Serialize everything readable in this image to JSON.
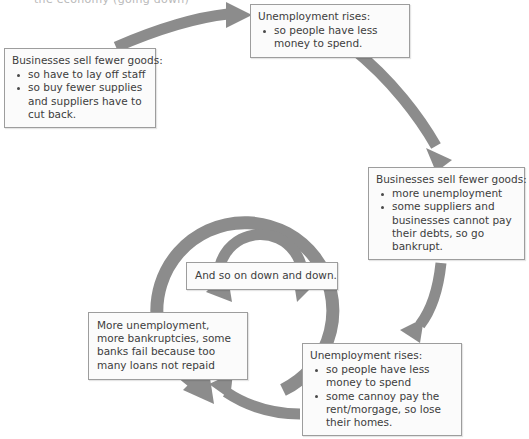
{
  "diagram": {
    "title_clipped": "the economy (going down)",
    "palette": {
      "arrow_gray": "#8c8c8c",
      "box_border": "#9d9d9d",
      "box_fill": "#fbfbfb",
      "text": "#3d3d3d"
    },
    "boxes": {
      "left": {
        "heading": "Businesses sell fewer goods:",
        "bullets": [
          "so have to lay off staff",
          "so buy fewer supplies and suppliers have to cut back."
        ]
      },
      "top": {
        "heading": "Unemployment rises:",
        "bullets": [
          "so people have less money to spend."
        ]
      },
      "right": {
        "heading": "Businesses sell fewer goods:",
        "bullets": [
          "more unemployment",
          "some suppliers and businesses cannot pay their debts, so go bankrupt."
        ]
      },
      "bottom_right": {
        "heading": "Unemployment rises:",
        "bullets": [
          "so people have less money to spend",
          "some cannoy pay the rent/morgage, so lose their homes."
        ]
      },
      "bottom_left": {
        "text": "More unemployment, more bankruptcies, some banks fail because too many loans not repaid"
      },
      "center": {
        "text": "And so on down and down."
      }
    },
    "connectors": [
      {
        "name": "left-to-top",
        "from": "left",
        "to": "top"
      },
      {
        "name": "top-to-right",
        "from": "top",
        "to": "right"
      },
      {
        "name": "right-to-bottom-right",
        "from": "right",
        "to": "bottom_right"
      },
      {
        "name": "bottom-right-to-bottom-left",
        "from": "bottom_right",
        "to": "bottom_left"
      },
      {
        "name": "outer-spiral-ring",
        "from": "cycle",
        "to": "cycle"
      },
      {
        "name": "inner-spiral-ring",
        "from": "cycle",
        "to": "cycle"
      }
    ]
  }
}
